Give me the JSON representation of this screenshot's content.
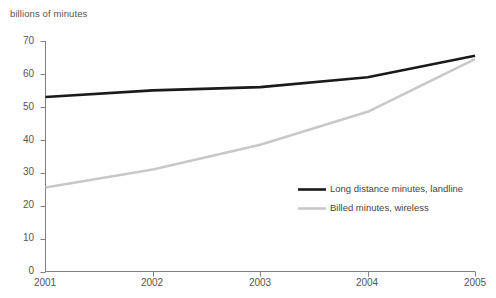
{
  "chart_data": {
    "type": "line",
    "title": "",
    "subtitle": "",
    "unit_label": "billions of minutes",
    "xlabel": "",
    "ylabel": "billions of minutes",
    "categories": [
      "2001",
      "2002",
      "2003",
      "2004",
      "2005"
    ],
    "x": [
      2001,
      2002,
      2003,
      2004,
      2005
    ],
    "xlim": [
      2001,
      2005
    ],
    "ylim": [
      0,
      70
    ],
    "ytick_values": [
      0,
      10,
      20,
      30,
      40,
      50,
      60,
      70
    ],
    "ytick_labels": [
      "0",
      "10",
      "20",
      "30",
      "40",
      "50",
      "60",
      "70"
    ],
    "xtick_labels": [
      "2001",
      "2002",
      "2003",
      "2004",
      "2005"
    ],
    "grid": false,
    "legend_position": "inside-lower-right",
    "series": [
      {
        "name": "Long distance minutes, landline",
        "color": "#1a1a1a",
        "values": [
          53,
          55,
          56,
          59,
          65.5
        ]
      },
      {
        "name": "Billed minutes, wireless",
        "color": "#c8c8c8",
        "values": [
          25.5,
          31,
          38.5,
          48.5,
          64.5
        ]
      }
    ],
    "annotations": []
  },
  "axis": {
    "line_color": "#808080"
  },
  "legend": {
    "items": [
      {
        "label": "Long distance minutes, landline",
        "color": "#1a1a1a"
      },
      {
        "label": "Billed minutes, wireless",
        "color": "#c8c8c8"
      }
    ]
  }
}
